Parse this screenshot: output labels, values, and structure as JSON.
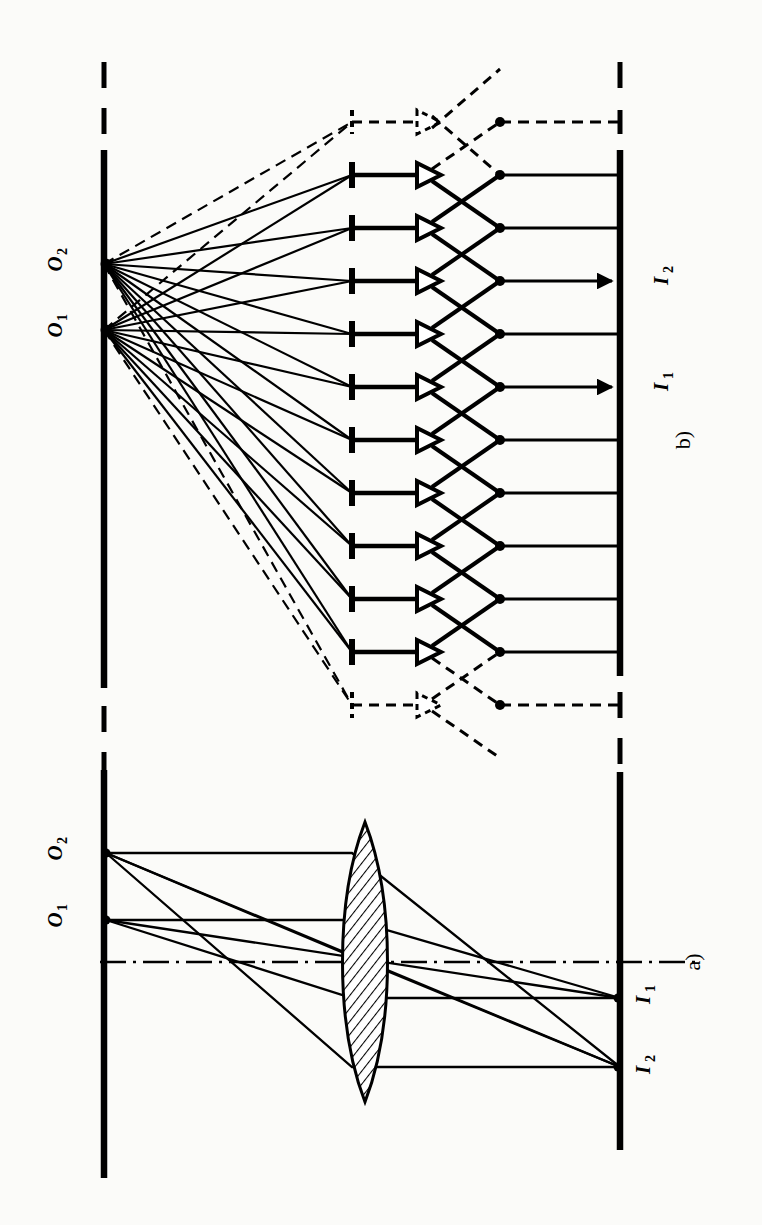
{
  "figure": {
    "orientation_note": "Figure is rotated 90 degrees (landscape content printed sideways on a portrait page)",
    "background_color": "#fbfbf9",
    "ink_color": "#000000"
  },
  "panels": [
    {
      "id": "b",
      "caption": "b)",
      "description": "Lenslet / integral-imaging array: each object point emits a fan of rays, each ray passes an aperture stop and a small lens element, rays cross and converge onto the image plane.",
      "object_labels": [
        {
          "name": "O2",
          "base": "O",
          "sub": "2"
        },
        {
          "name": "O1",
          "base": "O",
          "sub": "1"
        }
      ],
      "image_labels": [
        {
          "name": "I2",
          "base": "I",
          "sub": "2"
        },
        {
          "name": "I1",
          "base": "I",
          "sub": "1"
        }
      ],
      "element_counts": {
        "solid_apertures": 11,
        "dashed_apertures": 2,
        "solid_lenslets": 11,
        "dashed_lenslets": 2
      }
    },
    {
      "id": "a",
      "caption": "a)",
      "description": "Single converging lens forming an inverted real image: object points O1 and O2 map to image points I1 and I2 through a hatched biconvex lens, with a dash-dot optical axis.",
      "object_labels": [
        {
          "name": "O2",
          "base": "O",
          "sub": "2"
        },
        {
          "name": "O1",
          "base": "O",
          "sub": "1"
        }
      ],
      "image_labels": [
        {
          "name": "I1",
          "base": "I",
          "sub": "1"
        },
        {
          "name": "I2",
          "base": "I",
          "sub": "2"
        }
      ],
      "optical_axis": {
        "style": "dash-dot"
      },
      "lens": {
        "style": "hatched-biconvex"
      }
    }
  ]
}
